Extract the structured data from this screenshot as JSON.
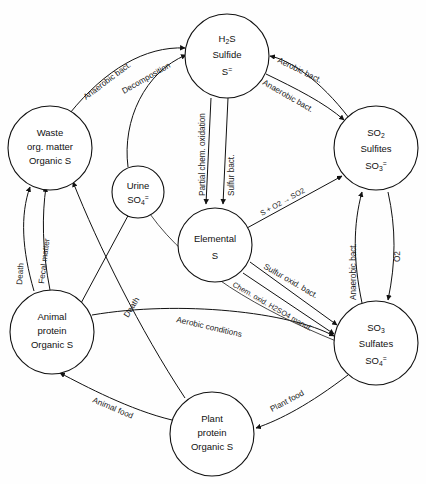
{
  "diagram": {
    "type": "cycle-diagram",
    "background_color": "#ffffff",
    "line_color": "#111111"
  },
  "nodes": [
    {
      "id": "h2s",
      "name": "hydrogen-sulfide-node",
      "lines": [
        "H2S",
        "Sulfide",
        "S="
      ],
      "line1_base": "H",
      "line1_sub": "2",
      "line1_tail": "S",
      "line2": "Sulfide",
      "line3_base": "S",
      "line3_sup": "=",
      "cx": 227,
      "cy": 56,
      "r": 42
    },
    {
      "id": "waste",
      "name": "waste-organic-matter-node",
      "lines": [
        "Waste",
        "org. matter",
        "Organic S"
      ],
      "line1": "Waste",
      "line2": "org. matter",
      "line3": "Organic S",
      "cx": 50,
      "cy": 148,
      "r": 42
    },
    {
      "id": "urine",
      "name": "urine-node",
      "lines": [
        "Urine",
        "SO4="
      ],
      "line1": "Urine",
      "line2_base": "SO",
      "line2_sub": "4",
      "line2_sup": "=",
      "cx": 138,
      "cy": 192,
      "r": 26
    },
    {
      "id": "so2",
      "name": "sulfur-dioxide-sulfites-node",
      "lines": [
        "SO2",
        "Sulfites",
        "SO3="
      ],
      "line1_base": "SO",
      "line1_sub": "2",
      "line2": "Sulfites",
      "line3_base": "SO",
      "line3_sub": "3",
      "line3_sup": "=",
      "cx": 376,
      "cy": 148,
      "r": 42
    },
    {
      "id": "elemental",
      "name": "elemental-sulfur-node",
      "lines": [
        "Elemental",
        "S"
      ],
      "line1": "Elemental",
      "line2": "S",
      "cx": 215,
      "cy": 245,
      "r": 37
    },
    {
      "id": "so3",
      "name": "sulfur-trioxide-sulfates-node",
      "lines": [
        "SO3",
        "Sulfates",
        "SO4="
      ],
      "line1_base": "SO",
      "line1_sub": "3",
      "line2": "Sulfates",
      "line3_base": "SO",
      "line3_sub": "4",
      "line3_sup": "=",
      "cx": 376,
      "cy": 343,
      "r": 42
    },
    {
      "id": "animal",
      "name": "animal-protein-node",
      "lines": [
        "Animal",
        "protein",
        "Organic S"
      ],
      "line1": "Animal",
      "line2": "protein",
      "line3": "Organic S",
      "cx": 52,
      "cy": 332,
      "r": 42
    },
    {
      "id": "plant",
      "name": "plant-protein-node",
      "lines": [
        "Plant",
        "protein",
        "Organic S"
      ],
      "line1": "Plant",
      "line2": "protein",
      "line3": "Organic S",
      "cx": 212,
      "cy": 434,
      "r": 42
    }
  ],
  "edge_labels": {
    "anaerobic_bact_decomp": "Anaerobic bact.",
    "decomposition": "Decomposition",
    "aerobic_bact_top": "Aerobic bact.",
    "anaerobic_bact_top": "Anaerobic bact.",
    "partial_chem_oxidation": "Partial chem. oxidation",
    "sulfur_bact": "Sulfur bact.",
    "s_plus_o2_so2": "S + O2 → SO2",
    "anaerobic_bact_right": "Anaerobic bact.",
    "o2_right": "O2",
    "sulfur_oxid_bact": "Sulfur oxid. bact.",
    "chem_oxid_h2so4": "Chem. oxid. H2SO4 manuf.",
    "aerobic_conditions": "Aerobic conditions",
    "death_left": "Death",
    "fecal_matter": "Fecal matter",
    "death_middle": "Death",
    "animal_food": "Animal food",
    "plant_food": "Plant food"
  }
}
